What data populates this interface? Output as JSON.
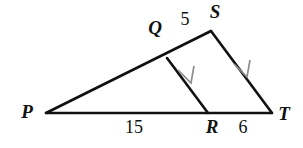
{
  "figure": {
    "kind": "geometry-diagram",
    "shape": "triangle-with-parallel-cevian",
    "background_color": "#ffffff",
    "line_color": "#111111",
    "mark_color": "#8c8c8c",
    "vertices": [
      {
        "name": "P",
        "label": "P",
        "x": 46,
        "y": 113,
        "label_x": 27,
        "label_y": 114
      },
      {
        "name": "S",
        "label": "S",
        "x": 211,
        "y": 31,
        "label_x": 215,
        "label_y": 14
      },
      {
        "name": "T",
        "label": "T",
        "x": 272,
        "y": 113,
        "label_x": 284,
        "label_y": 116
      },
      {
        "name": "Q",
        "label": "Q",
        "x": 167,
        "y": 58,
        "label_x": 155,
        "label_y": 30
      },
      {
        "name": "R",
        "label": "R",
        "x": 208,
        "y": 113,
        "label_x": 212,
        "label_y": 129
      }
    ],
    "segments": [
      {
        "name": "side-PS",
        "from": "P",
        "to": "S"
      },
      {
        "name": "side-ST",
        "from": "S",
        "to": "T"
      },
      {
        "name": "base-PT",
        "from": "P",
        "to": "T"
      },
      {
        "name": "cevian-QR",
        "from": "Q",
        "to": "R"
      }
    ],
    "measures": [
      {
        "name": "measure-QS",
        "value": "5",
        "segment": "QS",
        "x": 185,
        "y": 21
      },
      {
        "name": "measure-PR",
        "value": "15",
        "segment": "PR",
        "x": 134,
        "y": 129
      },
      {
        "name": "measure-RT",
        "value": "6",
        "segment": "RT",
        "x": 243,
        "y": 129
      }
    ],
    "parallel_marks": [
      {
        "name": "parallel-mark-qr",
        "on_segment": "cevian-QR",
        "x": 189,
        "y": 80
      },
      {
        "name": "parallel-mark-st",
        "on_segment": "side-ST",
        "x": 245,
        "y": 73
      }
    ]
  }
}
